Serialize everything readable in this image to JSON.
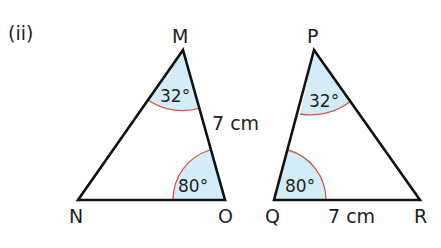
{
  "part_label": "(ii)",
  "colors": {
    "angle_fill": "#d4ecf7",
    "angle_arc": "#d2554a",
    "line": "#111111"
  },
  "triangles": [
    {
      "name": "MNO",
      "vertices": {
        "top": "M",
        "bottom_left": "N",
        "bottom_right": "O"
      },
      "angles": [
        {
          "vertex": "M",
          "label": "32°"
        },
        {
          "vertex": "O",
          "label": "80°"
        }
      ],
      "sides": [
        {
          "side": "MO",
          "label": "7 cm"
        }
      ]
    },
    {
      "name": "PQR",
      "vertices": {
        "top": "P",
        "bottom_left": "Q",
        "bottom_right": "R"
      },
      "angles": [
        {
          "vertex": "P",
          "label": "32°"
        },
        {
          "vertex": "Q",
          "label": "80°"
        }
      ],
      "sides": [
        {
          "side": "QR",
          "label": "7 cm"
        }
      ]
    }
  ]
}
